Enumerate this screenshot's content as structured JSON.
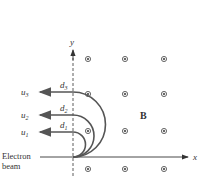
{
  "diagram": {
    "axes": {
      "x_label": "x",
      "y_label": "y"
    },
    "field_label": "B",
    "beam_label_line1": "Electron",
    "beam_label_line2": "beam",
    "exit_labels": [
      {
        "name": "u",
        "sub": "1"
      },
      {
        "name": "u",
        "sub": "2"
      },
      {
        "name": "u",
        "sub": "3"
      }
    ],
    "diameter_labels": [
      {
        "name": "d",
        "sub": "1"
      },
      {
        "name": "d",
        "sub": "2"
      },
      {
        "name": "d",
        "sub": "3"
      }
    ],
    "field_symbol": "dot-in-circle (out of page)",
    "colors": {
      "path": "#555555",
      "axis": "#333333",
      "text": "#333333"
    }
  }
}
